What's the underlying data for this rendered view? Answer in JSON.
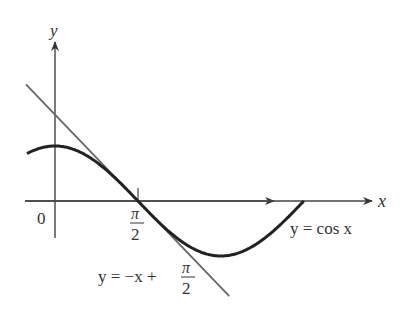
{
  "figure": {
    "axes": {
      "x_label": "x",
      "y_label": "y",
      "origin_label": "0",
      "tick_label_num": "π",
      "tick_label_den": "2"
    },
    "curve": {
      "name": "cosine",
      "label": "y = cos x",
      "color": "#222222"
    },
    "tangent": {
      "name": "tangent line",
      "label_prefix": "y = −x +",
      "label_frac_num": "π",
      "label_frac_den": "2",
      "color": "#555555"
    }
  },
  "chart_data": {
    "type": "line",
    "title": "",
    "xlabel": "x",
    "ylabel": "y",
    "series": [
      {
        "name": "y = cos x",
        "function": "cos(x)",
        "x_range": [
          -0.53,
          4.71
        ]
      },
      {
        "name": "y = -x + π/2",
        "function": "-x + pi/2",
        "x_range": [
          -0.55,
          3.3
        ]
      }
    ],
    "annotations": [
      "0",
      "π/2",
      "y = cos x",
      "y = -x + π/2"
    ],
    "grid": false
  }
}
